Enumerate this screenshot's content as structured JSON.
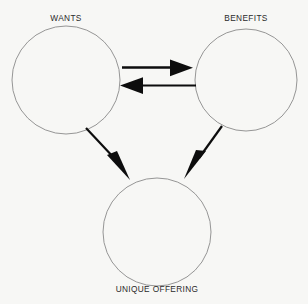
{
  "diagram": {
    "background_color": "#f7f7f5",
    "circle_stroke_color": "#8a8a8a",
    "arrow_color": "#0d0d0d",
    "label_color": "#2a2a2a",
    "nodes": [
      {
        "id": "wants",
        "label": "WANTS",
        "cx": 66,
        "cy": 80,
        "r": 54,
        "label_position": "above"
      },
      {
        "id": "benefits",
        "label": "BENEFITS",
        "cx": 246,
        "cy": 80,
        "r": 51,
        "label_position": "above"
      },
      {
        "id": "unique-offering",
        "label": "UNIQUE OFFERING",
        "cx": 157,
        "cy": 232,
        "r": 54,
        "label_position": "below"
      }
    ],
    "connectors": [
      {
        "id": "wants-to-benefits",
        "from": "wants",
        "to": "benefits",
        "direction": "right",
        "style": "solid-arrow"
      },
      {
        "id": "benefits-to-wants",
        "from": "benefits",
        "to": "wants",
        "direction": "left",
        "style": "solid-arrow"
      },
      {
        "id": "wants-to-unique-offering",
        "from": "wants",
        "to": "unique-offering",
        "direction": "down-right",
        "style": "solid-arrow"
      },
      {
        "id": "benefits-to-unique-offering",
        "from": "benefits",
        "to": "unique-offering",
        "direction": "down-left",
        "style": "solid-arrow"
      }
    ]
  }
}
